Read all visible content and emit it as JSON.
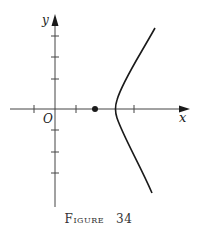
{
  "figure": {
    "caption_word": "Figure",
    "caption_number": "34",
    "axes": {
      "x_label": "x",
      "y_label": "y",
      "origin_label": "O",
      "x_ticks": [
        -1,
        1,
        3
      ],
      "y_ticks": [
        -3,
        -2,
        -1,
        1,
        2,
        3
      ]
    },
    "point": {
      "x": 2,
      "y": 0,
      "label": ""
    },
    "curve": {
      "type": "hyperbola-like branch opening right",
      "vertex": [
        3,
        0
      ],
      "upper_end": [
        4.8,
        3.8
      ],
      "lower_end": [
        4.6,
        -4
      ]
    },
    "colors": {
      "ink": "#1a1a1a",
      "background": "#ffffff"
    }
  }
}
